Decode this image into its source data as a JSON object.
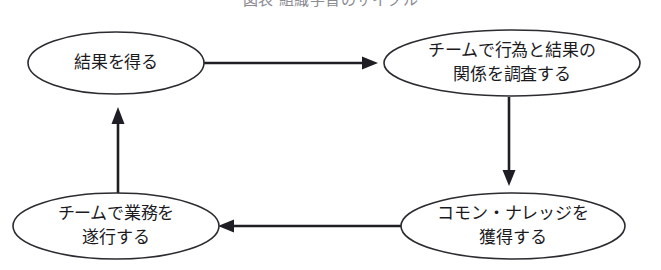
{
  "caption": {
    "text": "図表 組織学習のサイクル",
    "visible_state": "clipped-at-top"
  },
  "diagram": {
    "type": "cycle-flowchart",
    "shape": "ellipse",
    "background_color": "#ffffff",
    "line_color": "#1e1e24",
    "text_color": "#1b1b1f",
    "nodes": [
      {
        "id": "get-results",
        "lines": [
          "結果を得る"
        ],
        "cx": 116,
        "cy": 63,
        "rx": 88,
        "ry": 31
      },
      {
        "id": "investigate-relation",
        "lines": [
          "チームで行為と結果の",
          "関係を調査する"
        ],
        "cx": 512,
        "cy": 63,
        "rx": 128,
        "ry": 33
      },
      {
        "id": "acquire-common-knowledge",
        "lines": [
          "コモン・ナレッジを",
          "獲得する"
        ],
        "cx": 513,
        "cy": 226,
        "rx": 112,
        "ry": 33
      },
      {
        "id": "execute-work",
        "lines": [
          "チームで業務を",
          "遂行する"
        ],
        "cx": 116,
        "cy": 226,
        "rx": 103,
        "ry": 33
      }
    ],
    "edges": [
      {
        "id": "edge-get-results-to-investigate",
        "from": "get-results",
        "to": "investigate-relation",
        "direction": "right"
      },
      {
        "id": "edge-investigate-to-acquire",
        "from": "investigate-relation",
        "to": "acquire-common-knowledge",
        "direction": "down"
      },
      {
        "id": "edge-acquire-to-execute",
        "from": "acquire-common-knowledge",
        "to": "execute-work",
        "direction": "left"
      },
      {
        "id": "edge-execute-to-get-results",
        "from": "execute-work",
        "to": "get-results",
        "direction": "up"
      }
    ]
  }
}
